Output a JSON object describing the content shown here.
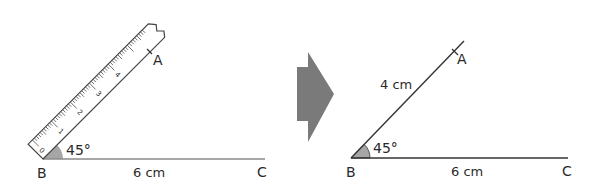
{
  "left_panel": {
    "vertex_labels": {
      "a": "A",
      "b": "B",
      "c": "C"
    },
    "angle_label": "45°",
    "base_length_label": "6 cm",
    "ruler": {
      "tick_numbers": [
        "0",
        "1",
        "2",
        "3",
        "4"
      ]
    }
  },
  "arrow": {
    "direction": "right",
    "color": "#7a7a7a"
  },
  "right_panel": {
    "vertex_labels": {
      "a": "A",
      "b": "B",
      "c": "C"
    },
    "angle_label": "45°",
    "side_ab_length_label": "4 cm",
    "base_length_label": "6 cm"
  },
  "colors": {
    "line": "#333333",
    "angle_fill": "#a6a6a6",
    "ruler_stroke": "#444444",
    "arrow": "#7a7a7a"
  }
}
